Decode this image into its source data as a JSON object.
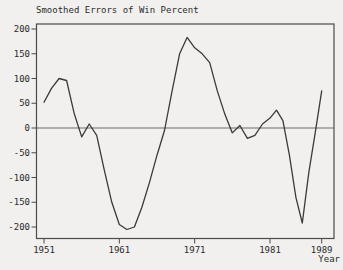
{
  "window": {
    "title": "Smoothed Errors of Win Percent"
  },
  "chart_data": {
    "type": "line",
    "title": "Smoothed Errors of Win Percent",
    "xlabel": "Year",
    "ylabel": "",
    "legend": "none",
    "grid": "off",
    "zero_line": true,
    "ylim": [
      -215,
      210
    ],
    "yticks": [
      200,
      150,
      100,
      50,
      0,
      -50,
      -100,
      -150,
      -200
    ],
    "xticks": [
      1951,
      1961,
      1971,
      1981,
      1989
    ],
    "x": [
      1951,
      1952,
      1953,
      1954,
      1955,
      1956,
      1957,
      1958,
      1959,
      1960,
      1961,
      1962,
      1963,
      1964,
      1965,
      1966,
      1967,
      1968,
      1969,
      1970,
      1971,
      1972,
      1973,
      1974,
      1975,
      1976,
      1977,
      1978,
      1979,
      1980,
      1981,
      1982,
      1983,
      1984,
      1985,
      1986,
      1987,
      1988,
      1989
    ],
    "series": [
      {
        "name": "smoothed-error",
        "values": [
          52,
          80,
          100,
          96,
          30,
          -18,
          8,
          -15,
          -85,
          -150,
          -195,
          -205,
          -200,
          -160,
          -110,
          -55,
          -5,
          75,
          150,
          183,
          162,
          150,
          132,
          75,
          28,
          -10,
          5,
          -21,
          -15,
          8,
          20,
          36,
          15,
          -55,
          -140,
          -192,
          -90,
          -10,
          75
        ]
      }
    ],
    "colors": {
      "line": "#3a3a3a",
      "frame": "#4a4a4a",
      "zero_line": "#6a6a6a",
      "background": "#f1f0ee",
      "text": "#2b2b2b"
    }
  }
}
